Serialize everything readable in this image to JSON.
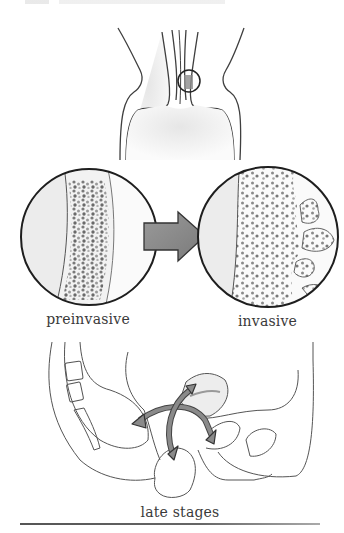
{
  "figure": {
    "panels": [
      {
        "id": "top",
        "subject": "uterine-cervix-overview",
        "highlight": "circle-marked-region"
      },
      {
        "id": "preinvasive",
        "caption": "preinvasive"
      },
      {
        "id": "invasive",
        "caption": "invasive"
      },
      {
        "id": "late",
        "caption": "late stages"
      }
    ],
    "captions": {
      "preinvasive": "preinvasive",
      "invasive": "invasive",
      "late_stages": "late stages"
    },
    "colors": {
      "line": "#3a3a3a",
      "arrow_fill": "#8e8e8e",
      "cells_dark": "#6f6f6f",
      "cells_light": "#a8a8a8",
      "tissue_shade": "#ececec",
      "rule": "#555555"
    },
    "icons": {
      "progression_arrow": "right-arrow",
      "spread_arrows": "four-way-curved-arrows"
    }
  }
}
